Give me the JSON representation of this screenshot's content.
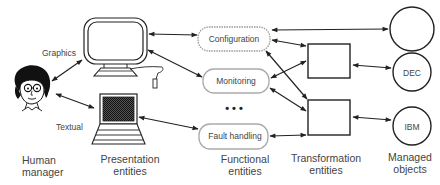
{
  "diagram": {
    "title": "",
    "edge_labels": {
      "graphics": "Graphics",
      "textual": "Textual"
    },
    "functional_entities": [
      {
        "id": "config",
        "label": "Configuration"
      },
      {
        "id": "monitor",
        "label": "Monitoring"
      },
      {
        "id": "fault",
        "label": "Fault handling"
      }
    ],
    "ellipsis": "• • •",
    "managed_objects": [
      {
        "id": "obj1",
        "label": ""
      },
      {
        "id": "dec",
        "label": "DEC"
      },
      {
        "id": "ibm",
        "label": "IBM"
      }
    ],
    "columns": [
      {
        "id": "human",
        "line1": "Human",
        "line2": "manager"
      },
      {
        "id": "presentation",
        "line1": "Presentation",
        "line2": "entities"
      },
      {
        "id": "functional",
        "line1": "Functional",
        "line2": "entities"
      },
      {
        "id": "transformation",
        "line1": "Transformation",
        "line2": "entities"
      },
      {
        "id": "managed",
        "line1": "Managed",
        "line2": "objects"
      }
    ],
    "nodes": [
      {
        "id": "human",
        "type": "person-icon"
      },
      {
        "id": "workstation",
        "type": "graphics-monitor"
      },
      {
        "id": "terminal",
        "type": "text-terminal"
      },
      {
        "id": "config",
        "type": "functional-entity"
      },
      {
        "id": "monitor",
        "type": "functional-entity"
      },
      {
        "id": "fault",
        "type": "functional-entity"
      },
      {
        "id": "tx1",
        "type": "transformation-entity"
      },
      {
        "id": "tx2",
        "type": "transformation-entity"
      },
      {
        "id": "obj1",
        "type": "managed-object"
      },
      {
        "id": "dec",
        "type": "managed-object"
      },
      {
        "id": "ibm",
        "type": "managed-object"
      }
    ],
    "edges": [
      {
        "from": "human",
        "to": "workstation",
        "label": "Graphics",
        "bidirectional": true
      },
      {
        "from": "human",
        "to": "terminal",
        "label": "Textual",
        "bidirectional": true
      },
      {
        "from": "workstation",
        "to": "config",
        "bidirectional": true
      },
      {
        "from": "workstation",
        "to": "monitor",
        "bidirectional": true
      },
      {
        "from": "terminal",
        "to": "fault",
        "bidirectional": true
      },
      {
        "from": "config",
        "to": "obj1",
        "bidirectional": true
      },
      {
        "from": "config",
        "to": "tx1",
        "bidirectional": true
      },
      {
        "from": "config",
        "to": "tx2",
        "bidirectional": true
      },
      {
        "from": "monitor",
        "to": "tx1",
        "bidirectional": true
      },
      {
        "from": "monitor",
        "to": "tx2",
        "bidirectional": true
      },
      {
        "from": "fault",
        "to": "tx2",
        "bidirectional": true
      },
      {
        "from": "tx1",
        "to": "dec",
        "bidirectional": true
      },
      {
        "from": "tx2",
        "to": "ibm",
        "bidirectional": true
      }
    ],
    "colors": {
      "stroke": "#222222",
      "entity_border": "#aaaaaa",
      "text": "#444444",
      "background": "#ffffff"
    }
  }
}
